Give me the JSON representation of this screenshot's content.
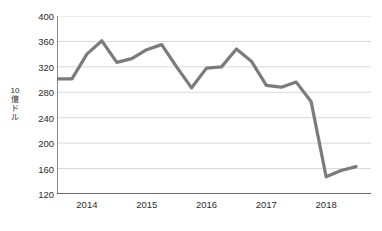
{
  "chart_data": {
    "type": "line",
    "title": "",
    "xlabel": "",
    "ylabel": "10億ドル",
    "ylabel_chars": [
      "10",
      "億",
      "ド",
      "ル"
    ],
    "ylim": [
      120,
      400
    ],
    "yticks": [
      120,
      160,
      200,
      240,
      280,
      320,
      360,
      400
    ],
    "ytick_labels": [
      "120",
      "160",
      "200",
      "240",
      "280",
      "320",
      "360",
      "400"
    ],
    "xticks": [
      2014,
      2015,
      2016,
      2017,
      2018
    ],
    "xtick_labels": [
      "2014",
      "2015",
      "2016",
      "2017",
      "2018"
    ],
    "xlim": [
      2013.5,
      2018.75
    ],
    "grid": "horizontal",
    "legend": "none",
    "series": [
      {
        "name": "",
        "color": "#7b7b7b",
        "line_width": 3.2,
        "x": [
          2013.5,
          2013.75,
          2014.0,
          2014.25,
          2014.5,
          2014.75,
          2015.0,
          2015.25,
          2015.5,
          2015.75,
          2016.0,
          2016.25,
          2016.5,
          2016.75,
          2017.0,
          2017.25,
          2017.5,
          2017.75,
          2018.0,
          2018.25,
          2018.5
        ],
        "values": [
          301,
          301,
          340,
          361,
          327,
          333,
          347,
          355,
          320,
          287,
          318,
          320,
          348,
          329,
          291,
          288,
          296,
          265,
          147,
          157,
          163
        ]
      }
    ],
    "colors": {
      "line": "#7b7b7b",
      "grid": "#d8d8d8",
      "axis": "#3a3a3a",
      "text": "#2b2b2b",
      "background": "#ffffff"
    }
  }
}
